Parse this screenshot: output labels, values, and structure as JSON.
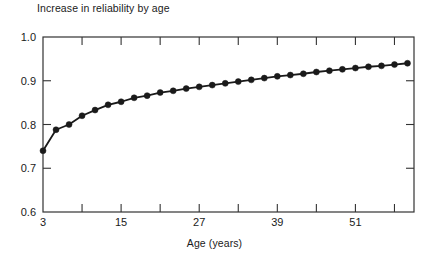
{
  "chart_data": {
    "type": "line",
    "title": "Increase in reliability by age",
    "xlabel": "Age (years)",
    "ylabel": "",
    "xlim": [
      3,
      60
    ],
    "ylim": [
      0.6,
      1.0
    ],
    "grid": false,
    "legend": null,
    "marker": "filled-circle",
    "line_color": "#1a1a1a",
    "marker_color": "#1a1a1a",
    "y_ticks": [
      0.6,
      0.7,
      0.8,
      0.9,
      1.0
    ],
    "y_tick_labels": [
      "0.6",
      "0.7",
      "0.8",
      "0.9",
      "1.0"
    ],
    "x_ticks": [
      3,
      9,
      15,
      21,
      27,
      33,
      39,
      45,
      51,
      57
    ],
    "x_tick_labels": [
      "3",
      "",
      "15",
      "",
      "27",
      "",
      "39",
      "",
      "51",
      ""
    ],
    "x_labeled_ticks": [
      3,
      15,
      27,
      39,
      51
    ],
    "series": [
      {
        "name": "Increase in reliability by age",
        "x": [
          3,
          5,
          7,
          9,
          11,
          13,
          15,
          17,
          19,
          21,
          23,
          25,
          27,
          29,
          31,
          33,
          35,
          37,
          39,
          41,
          43,
          45,
          47,
          49,
          51,
          53,
          55,
          57,
          59
        ],
        "values": [
          0.74,
          0.788,
          0.8,
          0.82,
          0.833,
          0.845,
          0.852,
          0.861,
          0.866,
          0.873,
          0.877,
          0.882,
          0.886,
          0.89,
          0.894,
          0.898,
          0.902,
          0.906,
          0.91,
          0.913,
          0.916,
          0.92,
          0.923,
          0.926,
          0.929,
          0.932,
          0.934,
          0.937,
          0.94
        ]
      }
    ]
  }
}
